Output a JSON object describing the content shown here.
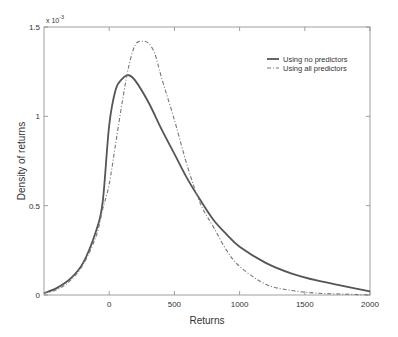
{
  "chart_data": {
    "type": "line",
    "title": "",
    "xlabel": "Returns",
    "ylabel": "Density of returns",
    "y_multiplier": "x 10",
    "y_exponent": "-3",
    "xlim": [
      -500,
      2000
    ],
    "ylim": [
      0,
      1.5
    ],
    "xticks": [
      "0",
      "500",
      "1000",
      "1500",
      "2000"
    ],
    "yticks": [
      "0",
      "0.5",
      "1",
      "1.5"
    ],
    "grid": false,
    "legend_position": "upper right",
    "series": [
      {
        "name": "Using no predictors",
        "style": "solid",
        "x": [
          -500,
          -400,
          -300,
          -200,
          -100,
          -50,
          0,
          50,
          100,
          150,
          200,
          300,
          400,
          500,
          600,
          700,
          800,
          900,
          1000,
          1200,
          1400,
          1600,
          1800,
          2000
        ],
        "values": [
          0.01,
          0.04,
          0.09,
          0.18,
          0.36,
          0.52,
          0.95,
          1.15,
          1.21,
          1.23,
          1.2,
          1.08,
          0.93,
          0.79,
          0.65,
          0.53,
          0.42,
          0.34,
          0.27,
          0.18,
          0.12,
          0.08,
          0.05,
          0.02
        ]
      },
      {
        "name": "Using all predictors",
        "style": "dash-dot",
        "x": [
          -500,
          -400,
          -300,
          -200,
          -100,
          -50,
          0,
          50,
          100,
          150,
          200,
          250,
          300,
          350,
          400,
          500,
          600,
          700,
          800,
          900,
          1000,
          1200,
          1400,
          1600,
          1800,
          2000
        ],
        "values": [
          0.01,
          0.03,
          0.08,
          0.17,
          0.33,
          0.48,
          0.62,
          0.85,
          1.08,
          1.28,
          1.4,
          1.42,
          1.41,
          1.35,
          1.22,
          0.98,
          0.72,
          0.51,
          0.38,
          0.25,
          0.16,
          0.06,
          0.025,
          0.01,
          0.005,
          0.0
        ]
      }
    ]
  }
}
